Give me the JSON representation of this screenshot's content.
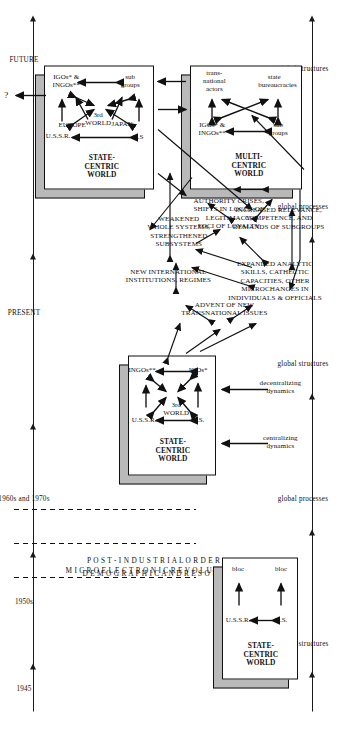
{
  "figure": {
    "orientation": "rotated-90",
    "timeline_axis": {
      "name": "time-axis",
      "labels": [
        "1945",
        "1950s",
        "1960s and 1970s",
        "PRESENT",
        "FUTURE"
      ]
    },
    "bottom_axis": {
      "name": "global-levels-axis",
      "labels": [
        "global structures",
        "global processes",
        "global structures",
        "global processes",
        "global structures"
      ]
    },
    "vertical_drivers": [
      "M I C R O E L E C T R O N I C   R E V O L U T I O N",
      "P O S T - I N D U S T R I A L   O R D E R",
      "D E M O G R A P H I C   A N D   R E S O U R C E   C H A N G E S"
    ],
    "boxes": [
      {
        "id": "box-1945",
        "title": "STATE-CENTRIC\nWORLD",
        "nodes": [
          "U.S.",
          "U.S.S.R.",
          "bloc",
          "bloc"
        ]
      },
      {
        "id": "box-1960s",
        "title": "STATE-CENTRIC\nWORLD",
        "nodes": [
          "U.S.",
          "U.S.S.R.",
          "3rd WORLD",
          "IGOs*",
          "INGOs**"
        ]
      },
      {
        "id": "box-present-state-centric",
        "title": "STATE-CENTRIC\nWORLD",
        "nodes": [
          "U.S",
          "U.S.S.R.",
          "3rd\nWORLD",
          "JAPAN",
          "EUROPE",
          "IGOs* &\nINGOs**",
          "sub\ngroups"
        ]
      },
      {
        "id": "box-present-multi-centric",
        "title": "MULTI-CENTRIC\nWORLD",
        "nodes": [
          "IGOs* &\nINGOs**",
          "sub\ngroups",
          "trans-\nnational\nactors",
          "state\nbureaucracies"
        ]
      }
    ],
    "dynamics_labels": [
      "centralizing\ndynamics",
      "decentralizing\ndynamics"
    ],
    "process_nodes": [
      "ADVENT OF NEW\nTRANSNATIONAL ISSUES",
      "NEW INTERNATIONAL\nINSTITUTIONS, REGIMES",
      "EXPANDED ANALYTIC\nSKILLS, CATHECTIC\nCAPACITIES, OTHER\nMICROCHANGES IN\nINDIVIDUALS & OFFICIALS",
      "WEAKENED\nWHOLE SYSTEMS,\nSTRENGTHENED\nSUBSYSTEMS",
      "AUTHORITY CRISES,\nSHIFTS IN LOCUS OF\nLEGITIMACY,\nFOCI OF LOYALTY",
      "INCREASED RELEVANCE,\nCOMPETENCE, AND\nDEMANDS OF SUBGROUPS",
      "GROWTH OF\nSUBGROUPISM"
    ],
    "future_marker": "?"
  }
}
